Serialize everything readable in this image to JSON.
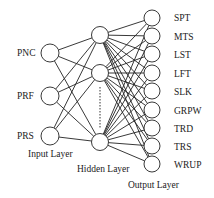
{
  "diagram": {
    "type": "neural-network",
    "input_layer": {
      "label": "Input Layer",
      "nodes": [
        {
          "label": "PNC",
          "x": 50,
          "y": 53
        },
        {
          "label": "PRF",
          "x": 50,
          "y": 96
        },
        {
          "label": "PRS",
          "x": 50,
          "y": 136
        }
      ]
    },
    "hidden_layer": {
      "label": "Hidden Layer",
      "nodes": [
        {
          "x": 100,
          "y": 35
        },
        {
          "x": 100,
          "y": 73
        },
        {
          "x": 100,
          "y": 142
        }
      ],
      "ellipsis": "dotted"
    },
    "output_layer": {
      "label": "Output Layer",
      "nodes": [
        {
          "label": "SPT",
          "x": 152,
          "y": 18
        },
        {
          "label": "MTS",
          "x": 152,
          "y": 36
        },
        {
          "label": "LST",
          "x": 152,
          "y": 54
        },
        {
          "label": "LFT",
          "x": 152,
          "y": 73
        },
        {
          "label": "SLK",
          "x": 152,
          "y": 91
        },
        {
          "label": "GRPW",
          "x": 152,
          "y": 110
        },
        {
          "label": "TRD",
          "x": 152,
          "y": 128
        },
        {
          "label": "TRS",
          "x": 152,
          "y": 146
        },
        {
          "label": "WRUP",
          "x": 152,
          "y": 164
        }
      ]
    }
  }
}
